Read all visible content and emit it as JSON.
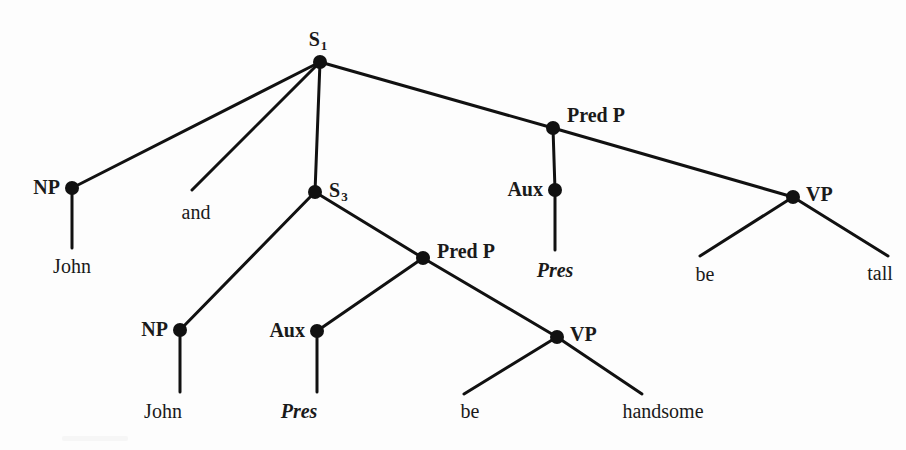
{
  "figure": {
    "kind": "syntax-tree",
    "sentence": "John and John Pres be handsome Pres be tall",
    "width": 906,
    "height": 450,
    "background_color": "#fdfdfd",
    "ink_color": "#111111"
  },
  "nodes": [
    {
      "id": "s1",
      "label": "S",
      "subscript": "1",
      "x": 320,
      "y": 62,
      "label_x": 318,
      "label_y": 40,
      "anchor": "center",
      "style": "node"
    },
    {
      "id": "np_top",
      "label": "NP",
      "subscript": "",
      "x": 72,
      "y": 188,
      "label_x": 60,
      "label_y": 187,
      "anchor": "right",
      "style": "node"
    },
    {
      "id": "s3",
      "label": "S",
      "subscript": "3",
      "x": 315,
      "y": 192,
      "label_x": 329,
      "label_y": 191,
      "anchor": "left",
      "style": "node"
    },
    {
      "id": "predp_top",
      "label": "Pred P",
      "subscript": "",
      "x": 553,
      "y": 128,
      "label_x": 567,
      "label_y": 115,
      "anchor": "left",
      "style": "node"
    },
    {
      "id": "aux_top",
      "label": "Aux",
      "subscript": "",
      "x": 555,
      "y": 190,
      "label_x": 543,
      "label_y": 189,
      "anchor": "right",
      "style": "node"
    },
    {
      "id": "vp_top",
      "label": "VP",
      "subscript": "",
      "x": 793,
      "y": 197,
      "label_x": 806,
      "label_y": 194,
      "anchor": "left",
      "style": "node"
    },
    {
      "id": "np_low",
      "label": "NP",
      "subscript": "",
      "x": 180,
      "y": 330,
      "label_x": 168,
      "label_y": 329,
      "anchor": "right",
      "style": "node"
    },
    {
      "id": "predp_low",
      "label": "Pred P",
      "subscript": "",
      "x": 423,
      "y": 258,
      "label_x": 437,
      "label_y": 251,
      "anchor": "left",
      "style": "node"
    },
    {
      "id": "aux_low",
      "label": "Aux",
      "subscript": "",
      "x": 317,
      "y": 331,
      "label_x": 305,
      "label_y": 330,
      "anchor": "right",
      "style": "node"
    },
    {
      "id": "vp_low",
      "label": "VP",
      "subscript": "",
      "x": 557,
      "y": 337,
      "label_x": 570,
      "label_y": 334,
      "anchor": "left",
      "style": "node"
    }
  ],
  "terminals": [
    {
      "id": "john_top",
      "text": "John",
      "x": 72,
      "y": 266,
      "italic": false,
      "from": "np_top",
      "line_to_x": 72,
      "line_to_y": 248
    },
    {
      "id": "pres_top",
      "text": "Pres",
      "x": 555,
      "y": 270,
      "italic": true,
      "from": "aux_top",
      "line_to_x": 555,
      "line_to_y": 250
    },
    {
      "id": "be_top",
      "text": "be",
      "x": 705,
      "y": 274,
      "italic": false,
      "from": "vp_top",
      "line_to_x": 718,
      "line_to_y": 253
    },
    {
      "id": "tall_top",
      "text": "tall",
      "x": 880,
      "y": 273,
      "italic": false,
      "from": "vp_top",
      "line_to_x": 872,
      "line_to_y": 253
    },
    {
      "id": "john_low",
      "text": "John",
      "x": 163,
      "y": 411,
      "italic": false,
      "from": "np_low",
      "line_to_x": 180,
      "line_to_y": 392
    },
    {
      "id": "pres_low",
      "text": "Pres",
      "x": 299,
      "y": 411,
      "italic": true,
      "from": "aux_low",
      "line_to_x": 317,
      "line_to_y": 392
    },
    {
      "id": "be_low",
      "text": "be",
      "x": 470,
      "y": 411,
      "italic": false,
      "from": "vp_low",
      "line_to_x": 483,
      "line_to_y": 391
    },
    {
      "id": "handsome",
      "text": "handsome",
      "x": 663,
      "y": 411,
      "italic": false,
      "from": "vp_low",
      "line_to_x": 628,
      "line_to_y": 391
    }
  ],
  "conjunction": {
    "text": "and",
    "x": 196,
    "y": 212,
    "branch_end_x": 192,
    "branch_end_y": 190
  },
  "edges": [
    {
      "id": "e-s1-np",
      "from": "s1",
      "to": "np_top",
      "x1": 320,
      "y1": 62,
      "x2": 72,
      "y2": 188
    },
    {
      "id": "e-s1-and",
      "from": "s1",
      "to": "and",
      "x1": 320,
      "y1": 62,
      "x2": 192,
      "y2": 190
    },
    {
      "id": "e-s1-s3",
      "from": "s1",
      "to": "s3",
      "x1": 320,
      "y1": 62,
      "x2": 315,
      "y2": 192
    },
    {
      "id": "e-s1-predp",
      "from": "s1",
      "to": "predp_top",
      "x1": 320,
      "y1": 62,
      "x2": 553,
      "y2": 128
    },
    {
      "id": "e-predp-aux",
      "from": "predp_top",
      "to": "aux_top",
      "x1": 553,
      "y1": 128,
      "x2": 555,
      "y2": 190
    },
    {
      "id": "e-predp-vp",
      "from": "predp_top",
      "to": "vp_top",
      "x1": 553,
      "y1": 128,
      "x2": 793,
      "y2": 197
    },
    {
      "id": "e-aux-pres",
      "from": "aux_top",
      "to": "pres_top",
      "x1": 555,
      "y1": 190,
      "x2": 555,
      "y2": 250
    },
    {
      "id": "e-vp-be",
      "from": "vp_top",
      "to": "be_top",
      "x1": 793,
      "y1": 197,
      "x2": 700,
      "y2": 256
    },
    {
      "id": "e-vp-tall",
      "from": "vp_top",
      "to": "tall_top",
      "x1": 793,
      "y1": 197,
      "x2": 888,
      "y2": 256
    },
    {
      "id": "e-np-john",
      "from": "np_top",
      "to": "john_top",
      "x1": 72,
      "y1": 188,
      "x2": 72,
      "y2": 248
    },
    {
      "id": "e-s3-np",
      "from": "s3",
      "to": "np_low",
      "x1": 315,
      "y1": 192,
      "x2": 180,
      "y2": 330
    },
    {
      "id": "e-s3-predp",
      "from": "s3",
      "to": "predp_low",
      "x1": 315,
      "y1": 192,
      "x2": 423,
      "y2": 258
    },
    {
      "id": "e-predpl-aux",
      "from": "predp_low",
      "to": "aux_low",
      "x1": 423,
      "y1": 258,
      "x2": 317,
      "y2": 331
    },
    {
      "id": "e-predpl-vp",
      "from": "predp_low",
      "to": "vp_low",
      "x1": 423,
      "y1": 258,
      "x2": 557,
      "y2": 337
    },
    {
      "id": "e-npl-john",
      "from": "np_low",
      "to": "john_low",
      "x1": 180,
      "y1": 330,
      "x2": 180,
      "y2": 392
    },
    {
      "id": "e-auxl-pres",
      "from": "aux_low",
      "to": "pres_low",
      "x1": 317,
      "y1": 331,
      "x2": 317,
      "y2": 392
    },
    {
      "id": "e-vpl-be",
      "from": "vp_low",
      "to": "be_low",
      "x1": 557,
      "y1": 337,
      "x2": 464,
      "y2": 394
    },
    {
      "id": "e-vpl-handsome",
      "from": "vp_low",
      "to": "handsome",
      "x1": 557,
      "y1": 337,
      "x2": 642,
      "y2": 394
    }
  ],
  "node_radius": 7,
  "edge_width": 3
}
